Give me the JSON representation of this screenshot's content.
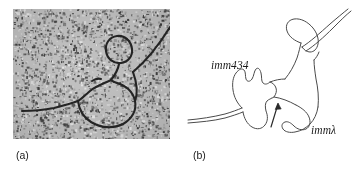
{
  "figure": {
    "width": 353,
    "height": 175,
    "background_color": "#ffffff",
    "ink_color": "#1a1a1a"
  },
  "panels": [
    {
      "id": "a",
      "caption": "(a)",
      "kind": "electron-micrograph",
      "description": "grainy grayscale electron micrograph of a heteroduplex DNA molecule",
      "frame": {
        "x": 13,
        "y": 9,
        "width": 157,
        "height": 130
      },
      "noise": {
        "base_color": "#b9b9b9",
        "dark_speckle_color": "#2d2d2d",
        "light_speckle_color": "#e6e6e6",
        "speckle_count": 2600
      },
      "strand_color": "#232323"
    },
    {
      "id": "b",
      "caption": "(b)",
      "kind": "line-diagram",
      "description": "interpretive line drawing of the substitution loop heteroduplex",
      "stroke_color": "#4a4a4a",
      "labels": [
        {
          "name": "imm434",
          "text": "imm434"
        },
        {
          "name": "imm-lambda",
          "text": "immλ"
        }
      ],
      "arrow": {
        "name": "branch-point-arrow",
        "description": "arrow pointing up-left to the duplex branch point"
      }
    }
  ],
  "captions": {
    "panel_a": "(a)",
    "panel_b": "(b)"
  },
  "labels": {
    "imm434": "imm434",
    "imm_lambda": "immλ"
  }
}
